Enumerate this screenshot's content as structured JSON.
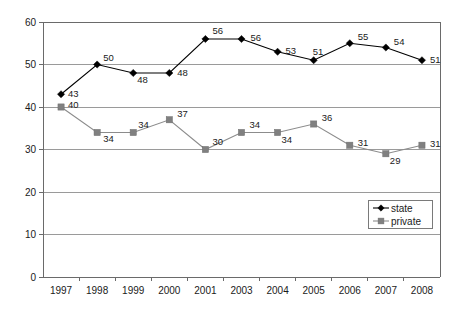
{
  "chart_data": {
    "type": "line",
    "title": "",
    "subtitle": "",
    "xlabel": "",
    "ylabel": "",
    "categories": [
      "1997",
      "1998",
      "1999",
      "2000",
      "2001",
      "2003",
      "2004",
      "2005",
      "2006",
      "2007",
      "2008"
    ],
    "ylim": [
      0,
      60
    ],
    "y_ticks": [
      0,
      10,
      20,
      30,
      40,
      50,
      60
    ],
    "y_tick_labels": [
      "0",
      "10",
      "20",
      "30",
      "40",
      "50",
      "60"
    ],
    "grid": "horizontal",
    "legend_position": "bottom-right",
    "series": [
      {
        "name": "state",
        "color": "#000000",
        "marker": "diamond",
        "values": [
          43,
          50,
          48,
          48,
          56,
          56,
          53,
          51,
          55,
          54,
          51
        ],
        "labels": [
          "43",
          "50",
          "48",
          "48",
          "56",
          "56",
          "53",
          "51",
          "55",
          "54",
          "51"
        ]
      },
      {
        "name": "private",
        "color": "#808080",
        "marker": "square",
        "values": [
          40,
          34,
          34,
          37,
          30,
          34,
          34,
          36,
          31,
          29,
          31
        ],
        "labels": [
          "40",
          "34",
          "34",
          "37",
          "30",
          "34",
          "34",
          "36",
          "31",
          "29",
          "31"
        ]
      }
    ]
  },
  "legend": {
    "entries": [
      {
        "label": "state"
      },
      {
        "label": "private"
      }
    ]
  },
  "colors": {
    "state": "#000000",
    "private": "#808080",
    "grid": "#9a9a9a",
    "axis": "#6a6a6a",
    "background": "#ffffff"
  }
}
